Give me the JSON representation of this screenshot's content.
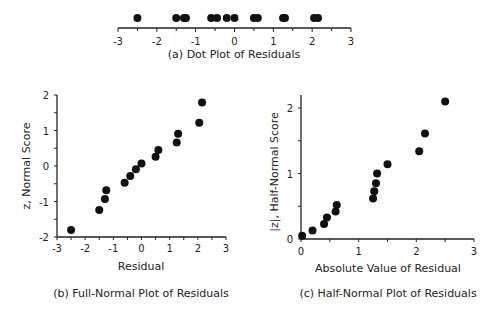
{
  "chart_data": [
    {
      "id": "a",
      "type": "scatter",
      "title": "(a) Dot Plot of Residuals",
      "xlabel": "",
      "ylabel": "",
      "xlim": [
        -3,
        3
      ],
      "xticks": [
        "-3",
        "-2",
        "-1",
        "0",
        "1",
        "2",
        "3"
      ],
      "grid": false,
      "x": [
        -2.5,
        -1.5,
        -1.3,
        -1.25,
        -0.6,
        -0.45,
        -0.2,
        0.0,
        0.5,
        0.6,
        1.25,
        1.3,
        2.05,
        2.15
      ]
    },
    {
      "id": "b",
      "type": "scatter",
      "title": "(b) Full-Normal Plot of Residuals",
      "xlabel": "Residual",
      "ylabel": "z, Normal Score",
      "xlim": [
        -3,
        3
      ],
      "ylim": [
        -2,
        2
      ],
      "xticks": [
        "-3",
        "-2",
        "-1",
        "0",
        "1",
        "2",
        "3"
      ],
      "yticks": [
        "-2",
        "-1",
        "0",
        "1",
        "2"
      ],
      "grid": false,
      "x": [
        -2.5,
        -1.5,
        -1.3,
        -1.25,
        -0.6,
        -0.4,
        -0.2,
        0.0,
        0.5,
        0.6,
        1.25,
        1.3,
        2.05,
        2.15
      ],
      "y": [
        -1.8,
        -1.24,
        -0.93,
        -0.68,
        -0.47,
        -0.28,
        -0.09,
        0.07,
        0.26,
        0.45,
        0.66,
        0.91,
        1.22,
        1.79
      ]
    },
    {
      "id": "c",
      "type": "scatter",
      "title": "(c) Half-Normal Plot of Residuals",
      "xlabel": "Absolute Value of Residual",
      "ylabel": "|z|, Half-Normal Score",
      "xlim": [
        0,
        3
      ],
      "ylim": [
        0,
        2.2
      ],
      "xticks": [
        "0",
        "1",
        "2",
        "3"
      ],
      "yticks": [
        "0",
        "1",
        "2"
      ],
      "grid": false,
      "x": [
        0.02,
        0.2,
        0.4,
        0.45,
        0.6,
        0.62,
        1.25,
        1.27,
        1.3,
        1.32,
        1.5,
        2.05,
        2.15,
        2.5
      ],
      "y": [
        0.05,
        0.13,
        0.23,
        0.33,
        0.42,
        0.52,
        0.62,
        0.73,
        0.85,
        1.0,
        1.14,
        1.34,
        1.61,
        2.1
      ]
    }
  ]
}
